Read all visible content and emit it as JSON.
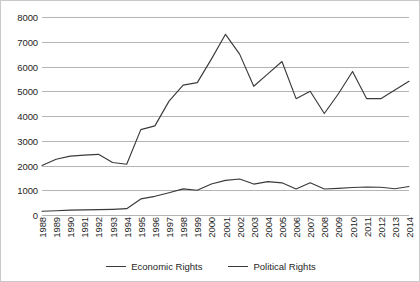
{
  "chart_data": {
    "type": "line",
    "title": "",
    "xlabel": "",
    "ylabel": "",
    "ylim": [
      0,
      8000
    ],
    "grid": true,
    "legend_position": "bottom",
    "categories": [
      "1988",
      "1989",
      "1990",
      "1991",
      "1992",
      "1993",
      "1994",
      "1995",
      "1996",
      "1997",
      "1998",
      "1999",
      "2000",
      "2001",
      "2002",
      "2003",
      "2004",
      "2005",
      "2006",
      "2007",
      "2008",
      "2009",
      "2010",
      "2011",
      "2012",
      "2013",
      "2014"
    ],
    "y_ticks": [
      0,
      1000,
      2000,
      3000,
      4000,
      5000,
      6000,
      7000,
      8000
    ],
    "y_tick_labels": [
      "0",
      "1000",
      "2000",
      "3000",
      "4000",
      "5000",
      "6000",
      "7000",
      "8000"
    ],
    "series": [
      {
        "name": "Economic Rights",
        "color": "#3a3a3a",
        "values": [
          150,
          170,
          195,
          205,
          215,
          230,
          255,
          650,
          755,
          900,
          1055,
          1000,
          1255,
          1400,
          1455,
          1250,
          1350,
          1300,
          1050,
          1300,
          1050,
          1075,
          1110,
          1130,
          1120,
          1060,
          1150
        ]
      },
      {
        "name": "Political Rights",
        "color": "#3a3a3a",
        "values": [
          2000,
          2250,
          2380,
          2420,
          2450,
          2120,
          2050,
          3450,
          3600,
          4600,
          5250,
          5350,
          6300,
          7300,
          6500,
          5200,
          5700,
          6200,
          4700,
          5000,
          4100,
          4900,
          5800,
          4700,
          4700,
          5050,
          5400
        ]
      }
    ]
  },
  "legend": {
    "items": [
      {
        "label": "Economic Rights"
      },
      {
        "label": "Political Rights"
      }
    ]
  }
}
